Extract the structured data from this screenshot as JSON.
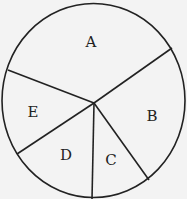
{
  "diagram": {
    "type": "pie-sector-diagram",
    "colors": {
      "background": "#f3f3f3",
      "stroke": "#222222",
      "text": "#222222"
    },
    "circle": {
      "cx": 93.5,
      "cy": 100.5,
      "rx": 91.5,
      "ry": 97
    },
    "center": {
      "x": 94,
      "y": 103
    },
    "boundaries": [
      {
        "between": [
          "A",
          "B"
        ],
        "end": {
          "x": 172,
          "y": 48
        }
      },
      {
        "between": [
          "B",
          "C"
        ],
        "end": {
          "x": 149,
          "y": 180
        }
      },
      {
        "between": [
          "C",
          "D"
        ],
        "end": {
          "x": 92,
          "y": 199
        }
      },
      {
        "between": [
          "D",
          "E"
        ],
        "end": {
          "x": 17,
          "y": 154
        }
      },
      {
        "between": [
          "E",
          "A"
        ],
        "end": {
          "x": 8,
          "y": 70
        }
      }
    ],
    "sectors": [
      {
        "label": "A",
        "x": 91,
        "y": 42
      },
      {
        "label": "B",
        "x": 152,
        "y": 116
      },
      {
        "label": "C",
        "x": 111,
        "y": 160
      },
      {
        "label": "D",
        "x": 66,
        "y": 155
      },
      {
        "label": "E",
        "x": 33,
        "y": 112
      }
    ]
  }
}
